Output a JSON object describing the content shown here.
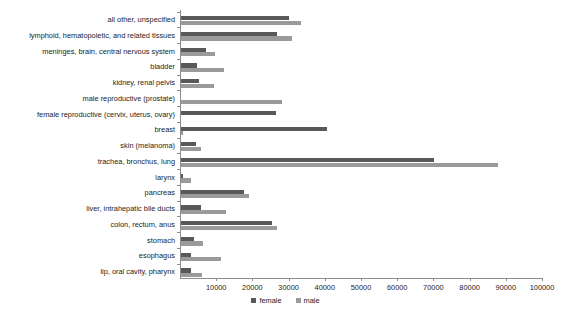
{
  "chart_data": {
    "type": "bar",
    "orientation": "horizontal",
    "title": "",
    "subtitle": "",
    "xlabel": "",
    "ylabel": "",
    "xlim": [
      0,
      100000
    ],
    "xticks": [
      10000,
      20000,
      30000,
      40000,
      50000,
      60000,
      70000,
      80000,
      90000,
      100000
    ],
    "xtick_labels": [
      "10000",
      "20000",
      "30000",
      "40000",
      "50000",
      "60000",
      "70000",
      "80000",
      "90000",
      "100000"
    ],
    "grid": false,
    "legend_position": "bottom",
    "categories": [
      "all other, unspecified",
      "lymphoid, hematopoietic, and related tissues",
      "meninges, brain, central nervous system",
      "bladder",
      "kidney, renal pelvis",
      "male reproductive (prostate)",
      "female reproductive (cervix, uterus, ovary)",
      "breast",
      "skin (melanoma)",
      "trachea, bronchus, lung",
      "larynx",
      "pancreas",
      "liver, intrahepatic bile ducts",
      "colon, rectum, anus",
      "stomach",
      "esophagus",
      "lip, oral cavity, pharynx"
    ],
    "series": [
      {
        "name": "female",
        "color": "#595959",
        "values": [
          29900,
          26600,
          6800,
          4400,
          5000,
          0,
          26300,
          40400,
          4200,
          69800,
          600,
          17400,
          5500,
          25200,
          3700,
          2700,
          2900
        ]
      },
      {
        "name": "male",
        "color": "#9a9a9a",
        "values": [
          33200,
          30700,
          9300,
          12000,
          9200,
          28000,
          0,
          500,
          5500,
          87500,
          2700,
          18800,
          12500,
          26600,
          6100,
          11100,
          5800
        ]
      }
    ]
  },
  "legend": {
    "items": [
      {
        "label": "female",
        "color": "#595959"
      },
      {
        "label": "male",
        "color": "#9a9a9a"
      }
    ]
  },
  "colors": {
    "female": "#595959",
    "male": "#9a9a9a",
    "axis": "#8d8d8d",
    "text": "#1c1c1c",
    "background": "#ffffff"
  }
}
